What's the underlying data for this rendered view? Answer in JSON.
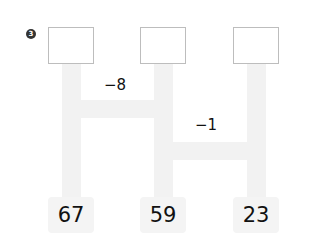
{
  "problem": {
    "number_badge": "3",
    "answer_boxes": [
      "",
      "",
      ""
    ],
    "operations": [
      {
        "label": "−8",
        "between": "column-1-and-column-2"
      },
      {
        "label": "−1",
        "between": "column-2-and-column-3"
      }
    ],
    "start_numbers": [
      "67",
      "59",
      "23"
    ]
  },
  "colors": {
    "path": "#f2f2f2",
    "box_border": "#bdbdbd",
    "text": "#111111"
  }
}
